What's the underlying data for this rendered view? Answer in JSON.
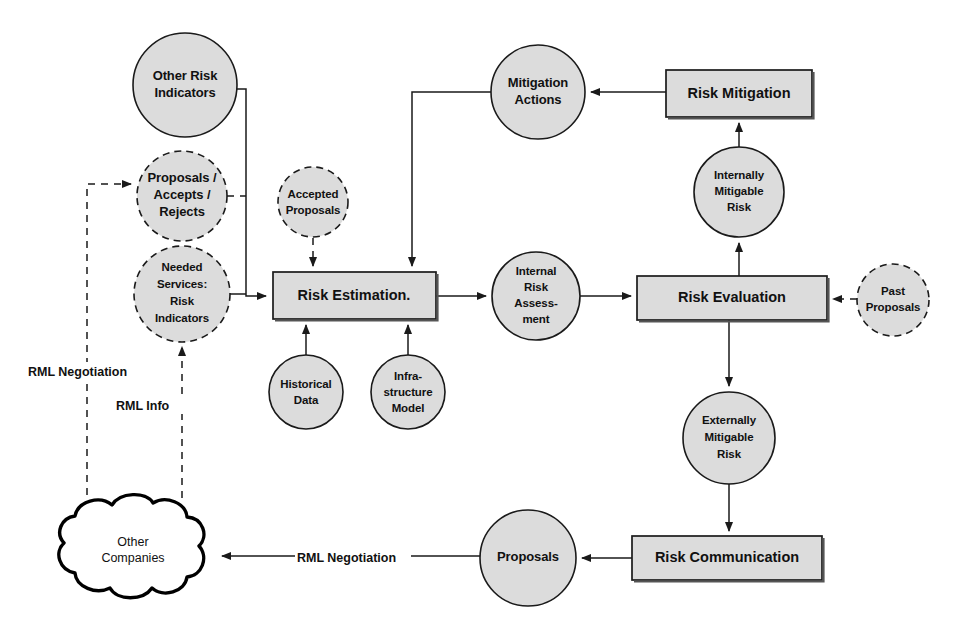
{
  "diagram": {
    "colors": {
      "node_fill": "#dcdcdc",
      "node_stroke": "#1a1a1a",
      "cloud_fill": "#ffffff",
      "background": "#ffffff"
    },
    "nodes": {
      "other_risk_indicators": {
        "label_lines": [
          "Other Risk",
          "Indicators"
        ],
        "shape": "circle",
        "border": "solid",
        "cx": 185,
        "cy": 85,
        "r": 52
      },
      "proposals_accepts_rejects": {
        "label_lines": [
          "Proposals /",
          "Accepts /",
          "Rejects"
        ],
        "shape": "circle",
        "border": "dashed",
        "cx": 182,
        "cy": 196,
        "r": 45
      },
      "needed_services_risk_indicators": {
        "label_lines": [
          "Needed",
          "Services:",
          "Risk",
          "Indicators"
        ],
        "shape": "circle",
        "border": "dashed",
        "cx": 182,
        "cy": 294,
        "r": 48
      },
      "accepted_proposals": {
        "label_lines": [
          "Accepted",
          "Proposals"
        ],
        "shape": "circle",
        "border": "dashed",
        "cx": 313,
        "cy": 202,
        "r": 35
      },
      "risk_estimation": {
        "label": "Risk Estimation.",
        "shape": "box",
        "x": 273,
        "y": 272,
        "w": 163,
        "h": 47
      },
      "historical_data": {
        "label_lines": [
          "Historical",
          "Data"
        ],
        "shape": "circle",
        "border": "solid",
        "cx": 306,
        "cy": 392,
        "r": 37
      },
      "infrastructure_model": {
        "label_lines": [
          "Infra-",
          "structure",
          "Model"
        ],
        "shape": "circle",
        "border": "solid",
        "cx": 408,
        "cy": 392,
        "r": 37
      },
      "internal_risk_assessment": {
        "label_lines": [
          "Internal",
          "Risk",
          "Assess-",
          "ment"
        ],
        "shape": "circle",
        "border": "solid",
        "cx": 536,
        "cy": 296,
        "r": 44
      },
      "mitigation_actions": {
        "label_lines": [
          "Mitigation",
          "Actions"
        ],
        "shape": "circle",
        "border": "solid",
        "cx": 538,
        "cy": 92,
        "r": 47
      },
      "risk_mitigation": {
        "label": "Risk Mitigation",
        "shape": "box",
        "x": 666,
        "y": 70,
        "w": 146,
        "h": 47
      },
      "internally_mitigable_risk": {
        "label_lines": [
          "Internally",
          "Mitigable",
          "Risk"
        ],
        "shape": "circle",
        "border": "solid",
        "cx": 739,
        "cy": 192,
        "r": 45
      },
      "risk_evaluation": {
        "label": "Risk Evaluation",
        "shape": "box",
        "x": 637,
        "y": 276,
        "w": 190,
        "h": 44
      },
      "past_proposals": {
        "label_lines": [
          "Past",
          "Proposals"
        ],
        "shape": "circle",
        "border": "dashed",
        "cx": 893,
        "cy": 300,
        "r": 36
      },
      "externally_mitigable_risk": {
        "label_lines": [
          "Externally",
          "Mitigable",
          "Risk"
        ],
        "shape": "circle",
        "border": "solid",
        "cx": 729,
        "cy": 438,
        "r": 46
      },
      "risk_communication": {
        "label": "Risk Communication",
        "shape": "box",
        "x": 632,
        "y": 536,
        "w": 190,
        "h": 44
      },
      "proposals": {
        "label": "Proposals",
        "shape": "circle",
        "border": "solid",
        "cx": 528,
        "cy": 558,
        "r": 48
      },
      "other_companies": {
        "label_lines": [
          "Other",
          "Companies"
        ],
        "shape": "cloud",
        "cx": 133,
        "cy": 550
      }
    },
    "edge_labels": {
      "rml_negotiation_left": "RML Negotiation",
      "rml_info": "RML Info",
      "rml_negotiation_bottom": "RML Negotiation"
    },
    "edges": [
      {
        "from": "other_risk_indicators",
        "to": "risk_estimation",
        "style": "solid"
      },
      {
        "from": "proposals_accepts_rejects",
        "to": "risk_estimation",
        "style": "dashed"
      },
      {
        "from": "needed_services_risk_indicators",
        "to": "risk_estimation",
        "style": "solid"
      },
      {
        "from": "accepted_proposals",
        "to": "risk_estimation",
        "style": "dashed"
      },
      {
        "from": "historical_data",
        "to": "risk_estimation",
        "style": "solid"
      },
      {
        "from": "infrastructure_model",
        "to": "risk_estimation",
        "style": "solid"
      },
      {
        "from": "mitigation_actions",
        "to": "risk_estimation",
        "style": "solid"
      },
      {
        "from": "risk_estimation",
        "to": "internal_risk_assessment",
        "style": "solid"
      },
      {
        "from": "internal_risk_assessment",
        "to": "risk_evaluation",
        "style": "solid"
      },
      {
        "from": "risk_evaluation",
        "to": "internally_mitigable_risk",
        "style": "solid"
      },
      {
        "from": "internally_mitigable_risk",
        "to": "risk_mitigation",
        "style": "solid"
      },
      {
        "from": "risk_mitigation",
        "to": "mitigation_actions",
        "style": "solid"
      },
      {
        "from": "past_proposals",
        "to": "risk_evaluation",
        "style": "dashed"
      },
      {
        "from": "risk_evaluation",
        "to": "externally_mitigable_risk",
        "style": "solid"
      },
      {
        "from": "externally_mitigable_risk",
        "to": "risk_communication",
        "style": "solid"
      },
      {
        "from": "risk_communication",
        "to": "proposals",
        "style": "solid"
      },
      {
        "from": "proposals",
        "to": "other_companies",
        "style": "solid",
        "label": "RML Negotiation"
      },
      {
        "from": "other_companies",
        "to": "proposals_accepts_rejects",
        "style": "dashed",
        "label": "RML Negotiation"
      },
      {
        "from": "other_companies",
        "to": "needed_services_risk_indicators",
        "style": "dashed",
        "label": "RML Info"
      }
    ]
  }
}
